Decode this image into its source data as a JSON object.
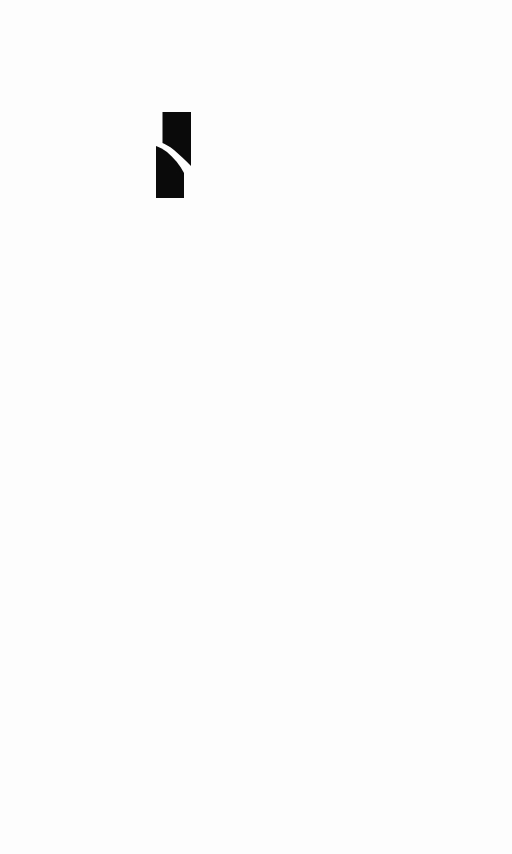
{
  "screen": {
    "background_color": "#fdfdfd"
  },
  "logo": {
    "icon": "split-bar-logo-icon",
    "color": "#0a0a0a"
  }
}
